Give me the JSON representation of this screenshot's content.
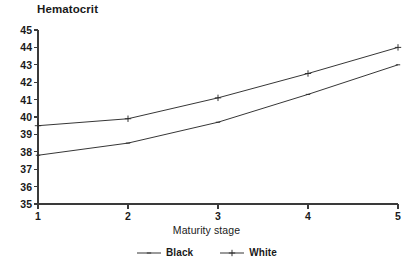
{
  "chart_data": {
    "type": "line",
    "title": "Hematocrit",
    "xlabel": "Maturity stage",
    "ylabel": "",
    "categories": [
      1,
      2,
      3,
      4,
      5
    ],
    "x": [
      1,
      2,
      3,
      4,
      5
    ],
    "series": [
      {
        "name": "Black",
        "marker": "small-tick",
        "values": [
          37.8,
          38.5,
          39.7,
          41.3,
          43.0
        ]
      },
      {
        "name": "White",
        "marker": "plus",
        "values": [
          39.5,
          39.9,
          41.1,
          42.5,
          44.0
        ]
      }
    ],
    "xlim": [
      1,
      5
    ],
    "ylim": [
      35,
      45
    ],
    "ytick_labels": [
      "45",
      "44",
      "43",
      "42",
      "41",
      "40",
      "39",
      "38",
      "37",
      "36",
      "35"
    ],
    "yticks": [
      45,
      44,
      43,
      42,
      41,
      40,
      39,
      38,
      37,
      36,
      35
    ],
    "xtick_labels": [
      "1",
      "2",
      "3",
      "4",
      "5"
    ],
    "xticks": [
      1,
      2,
      3,
      4,
      5
    ],
    "grid": false,
    "legend_position": "bottom-center",
    "legend": [
      "Black",
      "White"
    ],
    "line_color": "#2b2b2b",
    "axis_color": "#3a3a3a",
    "background_color": "#ffffff"
  }
}
